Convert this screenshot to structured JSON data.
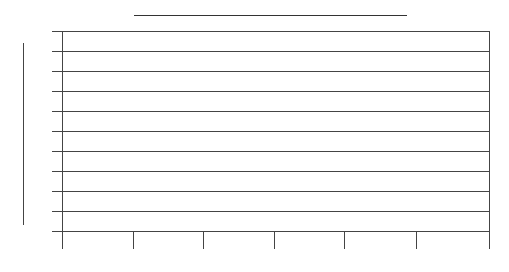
{
  "chart_data": {
    "type": "line",
    "title": "",
    "xlabel": "",
    "ylabel": "",
    "grid": {
      "horizontal": true,
      "vertical": false
    },
    "legend": null,
    "y_gridline_count": 11,
    "x_tick_count": 7,
    "series": [],
    "note": "All text labels (title, axis labels, tick labels) are rendered blank/near-white; only structural lines are visible."
  },
  "layout": {
    "plot": {
      "left": 62,
      "right": 489,
      "top": 31,
      "bottom": 231
    },
    "y_gridlines_px": [
      31,
      51,
      71,
      91,
      111,
      131,
      151,
      171,
      191,
      211,
      231
    ],
    "x_ticks_px": [
      62,
      133,
      203,
      274,
      344,
      416,
      489
    ],
    "line_color": "#444444",
    "background": "#ffffff"
  }
}
